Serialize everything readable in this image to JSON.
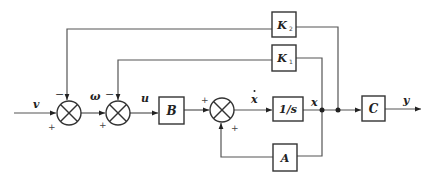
{
  "diagram": {
    "type": "block_diagram",
    "signals": {
      "input": "v",
      "omega": "ω",
      "control": "u",
      "state_derivative": "x",
      "state": "x",
      "output": "y"
    },
    "blocks": {
      "B": "B",
      "integrator": "1/s",
      "C": "C",
      "A": "A",
      "K1": "K",
      "K1_sub": "1",
      "K2": "K",
      "K2_sub": "2"
    },
    "signs": {
      "sum1_top": "−",
      "sum1_left": "+",
      "sum2_top": "−",
      "sum2_left": "+",
      "sum3_left": "+",
      "sum3_bottom": "+"
    },
    "colors": {
      "line": "#555555",
      "block_border": "#333333",
      "text": "#222222"
    }
  }
}
